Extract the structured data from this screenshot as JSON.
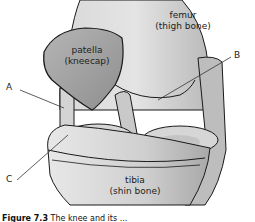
{
  "diagram": {
    "structures": [
      {
        "id": "femur",
        "label": "femur",
        "sublabel": "(thigh bone)"
      },
      {
        "id": "patella",
        "label": "patella",
        "sublabel": "(kneecap)"
      },
      {
        "id": "tibia",
        "label": "tibia",
        "sublabel": "(shin bone)"
      }
    ],
    "pointers": [
      {
        "letter": "A"
      },
      {
        "letter": "B"
      },
      {
        "letter": "C"
      }
    ],
    "colors": {
      "bone_light": "#e6e6e6",
      "bone_mid": "#c8c8c8",
      "patella": "#a9a9a9",
      "outline": "#1a1a1a"
    }
  },
  "caption": {
    "prefix": "Figure 7.3",
    "text": "The knee and its ..."
  }
}
